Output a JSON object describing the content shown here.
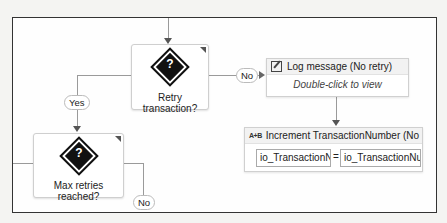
{
  "canvas": {
    "frame_border_color": "#333333",
    "connector_color": "#9a9a9a"
  },
  "nodes": {
    "retry_transaction": {
      "label": "Retry transaction?",
      "icon": "question-diamond-icon",
      "icon_glyph": "?"
    },
    "max_retries": {
      "label": "Max retries reached?",
      "icon": "question-diamond-icon",
      "icon_glyph": "?"
    },
    "log_message": {
      "title": "Log message (No retry)",
      "icon": "log-message-icon",
      "body": "Double-click to view"
    },
    "increment": {
      "title": "Increment TransactionNumber (No",
      "icon": "assign-icon",
      "icon_glyph": "A+B",
      "left_field": "io_TransactionNu",
      "operator": "=",
      "right_field": "io_TransactionNu"
    }
  },
  "edge_labels": {
    "retry_no": "No",
    "retry_yes": "Yes",
    "max_no": "No"
  }
}
